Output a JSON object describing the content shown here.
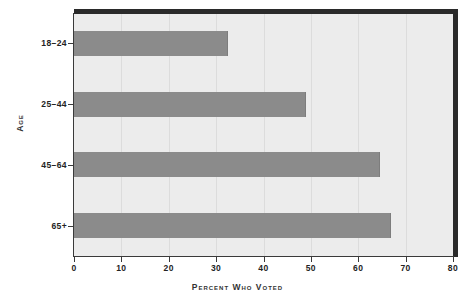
{
  "chart_data": {
    "type": "bar",
    "orientation": "horizontal",
    "title": "",
    "xlabel": "Percent Who Voted",
    "ylabel": "Age",
    "categories": [
      "18–24",
      "25–44",
      "45–64",
      "65+"
    ],
    "values": [
      32.5,
      49.0,
      64.5,
      67.0
    ],
    "xlim": [
      0,
      80
    ],
    "xticks": [
      "0",
      "10",
      "20",
      "30",
      "40",
      "50",
      "60",
      "70",
      "80"
    ],
    "xtick_values": [
      0,
      10,
      20,
      30,
      40,
      50,
      60,
      70,
      80
    ],
    "grid": "vertical",
    "legend": "none",
    "colors": {
      "bar": "#8b8b8b",
      "plot_background": "#ececec",
      "frame": "#2a2a2a",
      "gridline": "#dcdcdc",
      "text": "#232323",
      "page_background": "#ffffff"
    }
  }
}
